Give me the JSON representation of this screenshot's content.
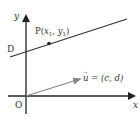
{
  "diagram": {
    "colors": {
      "axis": "#222222",
      "line": "#333333",
      "vector": "#888888",
      "text": "#333333",
      "background": "#ffffff"
    },
    "axes": {
      "x_label": "x",
      "y_label": "y",
      "origin_label": "O"
    },
    "line": {
      "intercept_label": "D"
    },
    "point": {
      "name": "P",
      "label_prefix": "P(",
      "x_var": "x",
      "x_sub": "1",
      "sep": ", ",
      "y_var": "y",
      "y_sub": "1",
      "label_suffix": ")"
    },
    "vector": {
      "name": "u",
      "arrow_glyph": "→",
      "equals": " = ",
      "value": "(c, d)"
    }
  }
}
